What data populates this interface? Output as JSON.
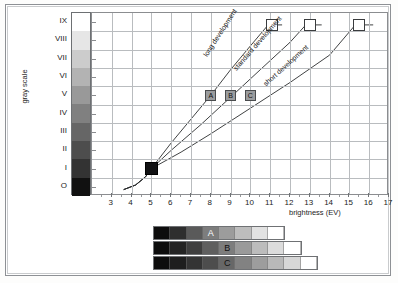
{
  "figure": {
    "y_axis_title": "gray scale",
    "x_axis_title": "brightness (EV)",
    "y_tick_labels": [
      "IX",
      "VIII",
      "VII",
      "VI",
      "V",
      "IV",
      "III",
      "II",
      "I",
      "O"
    ],
    "x_tick_labels": [
      "3",
      "4",
      "5",
      "6",
      "7",
      "8",
      "9",
      "10",
      "11",
      "12",
      "13",
      "14",
      "15",
      "16",
      "17"
    ]
  },
  "chart_data": {
    "type": "line",
    "title": "",
    "xlabel": "brightness (EV)",
    "ylabel": "gray scale",
    "xlim": [
      2,
      17
    ],
    "ylim": [
      0,
      9
    ],
    "grid": true,
    "legend_position": "inline-annotations",
    "x_ticks": [
      3,
      4,
      5,
      6,
      7,
      8,
      9,
      10,
      11,
      12,
      13,
      14,
      15,
      16,
      17
    ],
    "y_ticks": [
      "O",
      "I",
      "II",
      "III",
      "IV",
      "V",
      "VI",
      "VII",
      "VIII",
      "IX"
    ],
    "series": [
      {
        "name": "long development",
        "label": "long development",
        "points": [
          [
            3.6,
            -0.15
          ],
          [
            4.2,
            0.1
          ],
          [
            4.7,
            0.55
          ],
          [
            5.0,
            1.0
          ],
          [
            6.0,
            2.4
          ],
          [
            7.0,
            3.7
          ],
          [
            8.0,
            5.0
          ],
          [
            9.0,
            6.4
          ],
          [
            10.0,
            7.7
          ],
          [
            10.9,
            8.85
          ],
          [
            11.6,
            8.85
          ]
        ],
        "end_marker": {
          "x": 11.1,
          "y": 8.85,
          "style": "white-square"
        },
        "label_angle_deg": -57
      },
      {
        "name": "standard development",
        "label": "standard development",
        "points": [
          [
            3.6,
            -0.15
          ],
          [
            4.2,
            0.1
          ],
          [
            4.7,
            0.55
          ],
          [
            5.0,
            1.0
          ],
          [
            6.0,
            2.0
          ],
          [
            7.5,
            3.4
          ],
          [
            9.0,
            4.9
          ],
          [
            10.5,
            6.4
          ],
          [
            12.0,
            7.9
          ],
          [
            12.8,
            8.85
          ],
          [
            13.6,
            8.85
          ]
        ],
        "end_marker": {
          "x": 13.0,
          "y": 8.85,
          "style": "white-square"
        },
        "label_angle_deg": -49
      },
      {
        "name": "short development",
        "label": "short development",
        "points": [
          [
            3.6,
            -0.15
          ],
          [
            4.2,
            0.1
          ],
          [
            4.7,
            0.55
          ],
          [
            5.0,
            1.0
          ],
          [
            6.5,
            1.9
          ],
          [
            8.0,
            2.9
          ],
          [
            10.0,
            4.3
          ],
          [
            12.0,
            5.7
          ],
          [
            14.0,
            7.2
          ],
          [
            15.3,
            8.85
          ],
          [
            16.2,
            8.85
          ]
        ],
        "end_marker": {
          "x": 15.5,
          "y": 8.85,
          "style": "white-square"
        },
        "label_angle_deg": -42
      }
    ],
    "origin_marker": {
      "x": 5.0,
      "y": 1.0,
      "style": "black-square",
      "label": ""
    },
    "zone_markers": [
      {
        "label": "A",
        "x": 8.0,
        "y": 5.0
      },
      {
        "label": "B",
        "x": 9.0,
        "y": 5.0
      },
      {
        "label": "C",
        "x": 10.0,
        "y": 5.0
      }
    ]
  },
  "gray_scale_bar": {
    "name": "gray-scale-column",
    "steps": [
      "#ffffff",
      "#e6e6e6",
      "#cccccc",
      "#b3b3b3",
      "#999999",
      "#808080",
      "#666666",
      "#4d4d4d",
      "#333333",
      "#111111"
    ]
  },
  "strips": [
    {
      "label": "A",
      "name": "strip-a",
      "cells": [
        "#0d0d0d",
        "#2e2e2e",
        "#5a5a5a",
        "#7d7d7d",
        "#9c9c9c",
        "#bdbdbd",
        "#e2e2e2",
        "#ffffff"
      ],
      "label_cell_index": 3
    },
    {
      "label": "B",
      "name": "strip-b",
      "cells": [
        "#0d0d0d",
        "#242424",
        "#3f3f3f",
        "#5f5f5f",
        "#7d7d7d",
        "#9a9a9a",
        "#bcbcbc",
        "#dcdcdc",
        "#ffffff"
      ],
      "label_cell_index": 4
    },
    {
      "label": "C",
      "name": "strip-c",
      "cells": [
        "#0d0d0d",
        "#1e1e1e",
        "#343434",
        "#4d4d4d",
        "#676767",
        "#828282",
        "#9d9d9d",
        "#b9b9b9",
        "#d7d7d7",
        "#ffffff"
      ],
      "label_cell_index": 4
    }
  ],
  "colors": {
    "grid": "#b9bcbf",
    "axis": "#8b8d90",
    "curve": "#2a2c2e",
    "frame": "#8e9195",
    "text": "#1c1c1c"
  }
}
